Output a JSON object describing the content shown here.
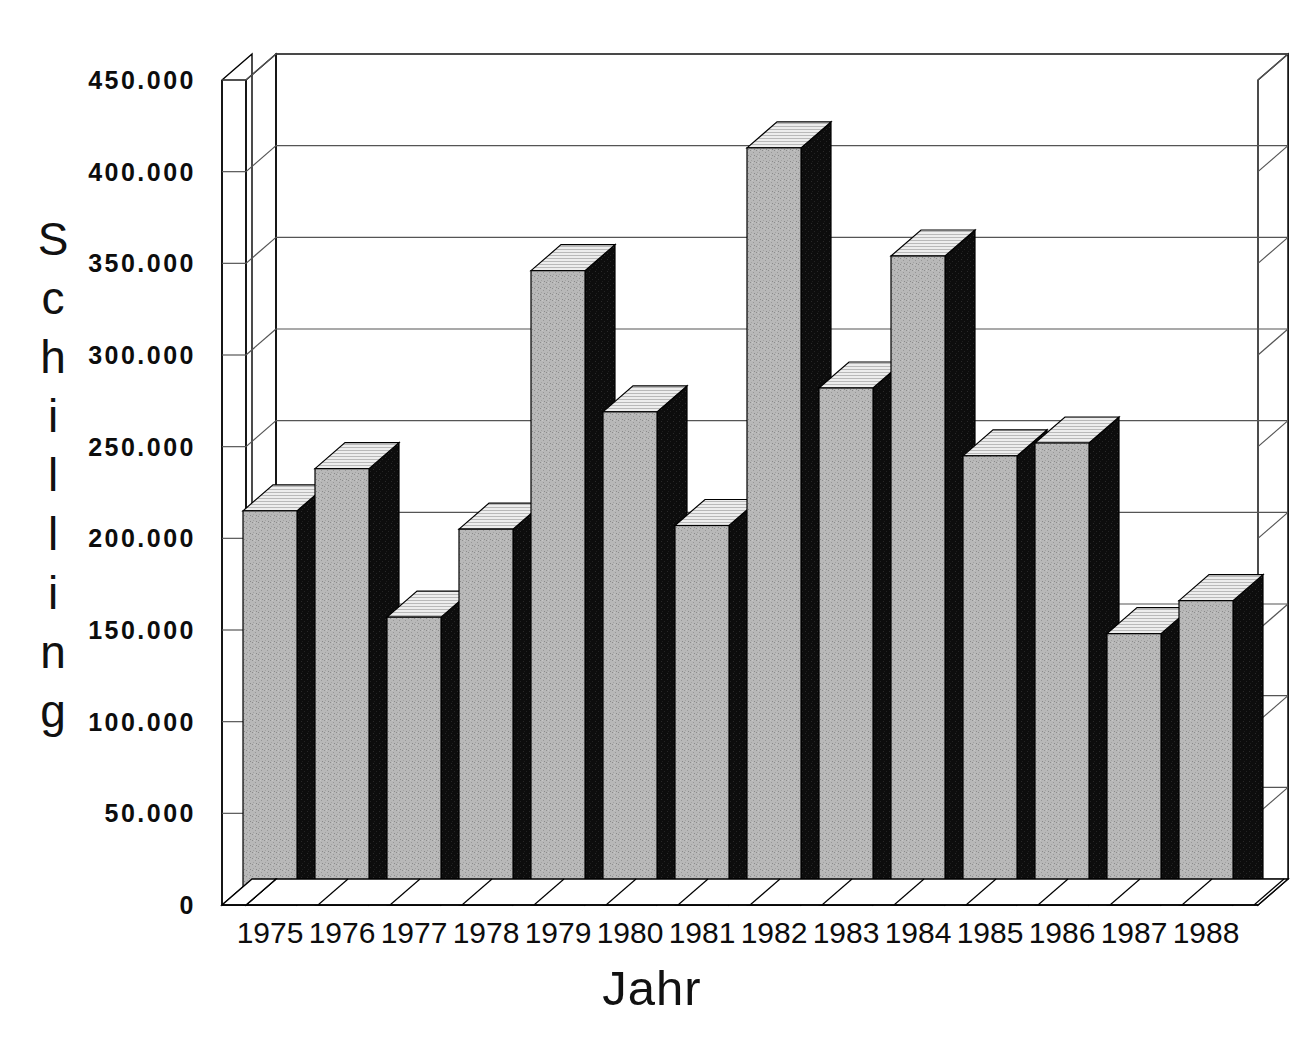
{
  "chart_data": {
    "type": "bar",
    "title": "",
    "subtitle": "",
    "xlabel": "Jahr",
    "ylabel": "Schilling",
    "categories": [
      "1975",
      "1976",
      "1977",
      "1978",
      "1979",
      "1980",
      "1981",
      "1982",
      "1983",
      "1984",
      "1985",
      "1986",
      "1987",
      "1988"
    ],
    "values": [
      215000,
      238000,
      157000,
      205000,
      346000,
      269000,
      207000,
      413000,
      282000,
      354000,
      245000,
      252000,
      148000,
      166000
    ],
    "series": [
      {
        "name": "Schilling",
        "values": [
          215000,
          238000,
          157000,
          205000,
          346000,
          269000,
          207000,
          413000,
          282000,
          354000,
          245000,
          252000,
          148000,
          166000
        ]
      }
    ],
    "ylim": [
      0,
      450000
    ],
    "ytick_values": [
      0,
      50000,
      100000,
      150000,
      200000,
      250000,
      300000,
      350000,
      400000,
      450000
    ],
    "ytick_labels": [
      "0",
      "50.000",
      "100.000",
      "150.000",
      "200.000",
      "250.000",
      "300.000",
      "350.000",
      "400.000",
      "450.000"
    ],
    "grid": true,
    "legend": null,
    "legend_position": "none",
    "style": "3d-column",
    "annotations": [],
    "colors": {
      "bar_front": "#b0b0b0",
      "bar_side": "#111111",
      "bar_top": "#e8e8e8",
      "outline": "#000000",
      "gridline": "#555555",
      "background": "#ffffff",
      "text": "#0d0d0d"
    }
  },
  "axis": {
    "y_title_letters": [
      "S",
      "c",
      "h",
      "i",
      "l",
      "l",
      "i",
      "n",
      "g"
    ],
    "y_title_text": "Schilling",
    "x_title_text": "Jahr"
  }
}
